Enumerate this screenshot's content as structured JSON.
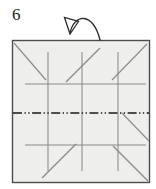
{
  "figure": {
    "step_number": "6",
    "paper": {
      "shape": "square",
      "fill_color": "#eeeeec",
      "border_color": "#4d4d4d",
      "x": 12,
      "y": 40,
      "width": 138,
      "height": 143
    },
    "colors": {
      "paper_fill": "#eeeeec",
      "paper_border": "#4d4d4d",
      "crease_line": "#7a7a7a",
      "fold_axis_line": "#1a1a1a",
      "arrow_line": "#2b2b2b",
      "label_text": "#1a1a1a",
      "background": "#ffffff"
    },
    "creases": {
      "vertical": [
        {
          "name": "vertical-crease-left",
          "x": 48,
          "y1": 52,
          "y2": 171
        },
        {
          "name": "vertical-crease-center",
          "x": 82,
          "y1": 52,
          "y2": 171
        },
        {
          "name": "vertical-crease-right",
          "x": 118,
          "y1": 52,
          "y2": 171
        }
      ],
      "horizontal": [
        {
          "name": "horizontal-crease-upper",
          "y": 84,
          "x1": 25,
          "x2": 146
        },
        {
          "name": "horizontal-crease-lower",
          "y": 145,
          "x1": 25,
          "x2": 146
        }
      ],
      "diagonal": [
        {
          "name": "diagonal-crease-top-left",
          "x1": 14,
          "y1": 43,
          "x2": 46,
          "y2": 80
        },
        {
          "name": "diagonal-crease-top-center",
          "x1": 66,
          "y1": 82,
          "x2": 100,
          "y2": 48
        },
        {
          "name": "diagonal-crease-top-right",
          "x1": 112,
          "y1": 80,
          "x2": 147,
          "y2": 44
        },
        {
          "name": "diagonal-crease-bottom-left",
          "x1": 42,
          "y1": 178,
          "x2": 76,
          "y2": 144
        },
        {
          "name": "diagonal-crease-bottom-center",
          "x1": 113,
          "y1": 146,
          "x2": 148,
          "y2": 181
        },
        {
          "name": "diagonal-crease-bottom-right-upper",
          "x1": 122,
          "y1": 113,
          "x2": 149,
          "y2": 141
        }
      ]
    },
    "fold_axis": {
      "name": "fold-axis-line",
      "style": "dash-dot-dot",
      "y": 113,
      "x1": 13,
      "x2": 149,
      "meaning": "mountain or valley fold axis"
    },
    "arrow": {
      "name": "fold-arrow",
      "style": "curved-arc-hollow-head",
      "meaning": "fold behind / turn over",
      "head_filled": false,
      "path": "M 70 33 C 74 14, 92 12, 100 40",
      "head_points": "70,33 65,19 78,22"
    }
  }
}
